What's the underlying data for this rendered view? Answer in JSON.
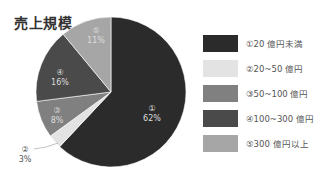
{
  "title": "売上規模",
  "chart_data": {
    "type": "pie",
    "title": "売上規模",
    "categories": [
      "①20 億円未満",
      "②20~50 億円",
      "③50~100 億円",
      "④100~300 億円",
      "⑤300 億円以上"
    ],
    "values": [
      62,
      3,
      8,
      16,
      11
    ],
    "unit": "%",
    "slice_labels": [
      {
        "num": "①",
        "pct": "62%"
      },
      {
        "num": "②",
        "pct": "3%"
      },
      {
        "num": "③",
        "pct": "8%"
      },
      {
        "num": "④",
        "pct": "16%"
      },
      {
        "num": "⑤",
        "pct": "11%"
      }
    ],
    "colors": [
      "#2b2b2b",
      "#e3e3e3",
      "#808080",
      "#4a4a4a",
      "#a6a6a6"
    ],
    "legend_position": "right",
    "start_angle": "12 o'clock, clockwise"
  },
  "legend": [
    {
      "label": "①20 億円未満",
      "color": "#2b2b2b"
    },
    {
      "label": "②20~50 億円",
      "color": "#e3e3e3"
    },
    {
      "label": "③50~100 億円",
      "color": "#808080"
    },
    {
      "label": "④100~300 億円",
      "color": "#4a4a4a"
    },
    {
      "label": "⑤300 億円以上",
      "color": "#a6a6a6"
    }
  ]
}
